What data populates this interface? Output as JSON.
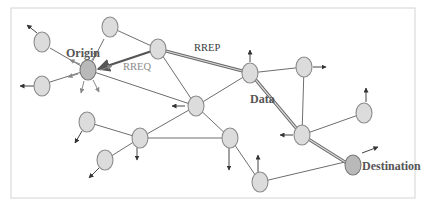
{
  "diagram": {
    "type": "ad-hoc network routing (AODV) diagram",
    "labels": {
      "origin": "Origin",
      "destination": "Destination",
      "rreq": "RREQ",
      "rrep": "RREP",
      "data": "Data"
    },
    "colors": {
      "node_fill": "#dcdcdc",
      "endpoint_fill": "#b9b9b9",
      "link": "#6e6e6e",
      "route": "#6a6a6a"
    },
    "nodes": [
      {
        "id": "origin",
        "x": 88,
        "y": 70,
        "role": "origin"
      },
      {
        "id": "n_top",
        "x": 110,
        "y": 27
      },
      {
        "id": "n_left1",
        "x": 42,
        "y": 42
      },
      {
        "id": "n_left2",
        "x": 42,
        "y": 86
      },
      {
        "id": "hub1",
        "x": 158,
        "y": 49
      },
      {
        "id": "center",
        "x": 196,
        "y": 106
      },
      {
        "id": "data_node",
        "x": 250,
        "y": 73
      },
      {
        "id": "n_r1",
        "x": 304,
        "y": 67
      },
      {
        "id": "n_r2",
        "x": 364,
        "y": 113
      },
      {
        "id": "n_mid",
        "x": 302,
        "y": 135
      },
      {
        "id": "destination",
        "x": 353,
        "y": 165,
        "role": "destination"
      },
      {
        "id": "n_bl1",
        "x": 87,
        "y": 122
      },
      {
        "id": "n_bl2",
        "x": 140,
        "y": 138
      },
      {
        "id": "n_bl3",
        "x": 105,
        "y": 160
      },
      {
        "id": "n_bot",
        "x": 230,
        "y": 138
      },
      {
        "id": "n_bottom",
        "x": 260,
        "y": 182
      }
    ],
    "links": [
      [
        "origin",
        "n_top"
      ],
      [
        "origin",
        "n_left1"
      ],
      [
        "origin",
        "n_left2"
      ],
      [
        "origin",
        "center"
      ],
      [
        "n_top",
        "hub1"
      ],
      [
        "hub1",
        "center"
      ],
      [
        "center",
        "data_node"
      ],
      [
        "center",
        "n_bl2"
      ],
      [
        "center",
        "n_bot"
      ],
      [
        "n_bl1",
        "n_bl2"
      ],
      [
        "n_bl2",
        "n_bl3"
      ],
      [
        "n_bl2",
        "n_bot"
      ],
      [
        "n_bot",
        "n_bottom"
      ],
      [
        "n_bottom",
        "destination"
      ],
      [
        "data_node",
        "n_r1"
      ],
      [
        "n_r1",
        "n_mid"
      ],
      [
        "n_mid",
        "n_r2"
      ]
    ],
    "route": [
      "origin",
      "hub1",
      "data_node",
      "n_mid",
      "destination"
    ]
  }
}
